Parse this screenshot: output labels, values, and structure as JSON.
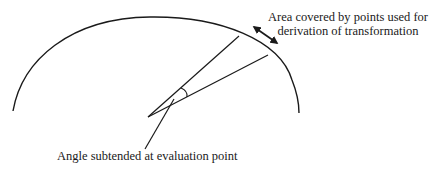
{
  "diagram": {
    "labels": {
      "area_line1": "Area covered by points used for",
      "area_line2": "derivation of transformation",
      "angle": "Angle subtended at evaluation point"
    },
    "colors": {
      "stroke": "#1a1a1a",
      "background": "#ffffff"
    },
    "elements": [
      "boundary-arc",
      "wedge-upper-ray",
      "wedge-lower-ray",
      "angle-arc",
      "angle-pointer-line",
      "double-headed-arrow"
    ]
  }
}
